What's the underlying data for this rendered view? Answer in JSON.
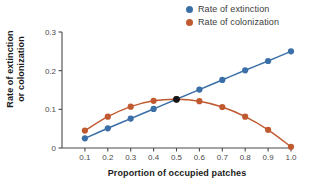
{
  "chart_data": {
    "type": "line",
    "title": "",
    "xlabel": "Proportion of occupied patches",
    "ylabel": "Rate of extinction or colonization",
    "ylabel_line1": "Rate of extinction",
    "ylabel_line2": "or colonization",
    "x": [
      0.1,
      0.2,
      0.3,
      0.4,
      0.5,
      0.6,
      0.7,
      0.8,
      0.9,
      1.0
    ],
    "xlim": [
      0.0,
      1.0
    ],
    "ylim": [
      0.0,
      0.3
    ],
    "xticks": [
      0.1,
      0.2,
      0.3,
      0.4,
      0.5,
      0.6,
      0.7,
      0.8,
      0.9,
      1.0
    ],
    "xtick_labels": [
      "0.1",
      "0.2",
      "0.3",
      "0.4",
      "0.5",
      "0.6",
      "0.7",
      "0.8",
      "0.9",
      "1.0"
    ],
    "yticks": [
      0,
      0.1,
      0.2,
      0.3
    ],
    "ytick_labels": [
      "0",
      "0.1",
      "0.2",
      "0.3"
    ],
    "grid": false,
    "legend_position": "top-right",
    "series": [
      {
        "name": "Rate of extinction",
        "color": "#3a6fa8",
        "marker": "circle",
        "values": [
          0.025,
          0.051,
          0.076,
          0.101,
          0.126,
          0.151,
          0.176,
          0.201,
          0.225,
          0.25
        ]
      },
      {
        "name": "Rate of colonization",
        "color": "#c0592f",
        "marker": "circle",
        "values": [
          0.045,
          0.081,
          0.107,
          0.122,
          0.126,
          0.121,
          0.106,
          0.081,
          0.047,
          0.003
        ]
      }
    ],
    "annotations": [
      {
        "name": "equilibrium-point",
        "x": 0.5,
        "y": 0.126,
        "color": "#151515",
        "label": ""
      }
    ]
  },
  "legend": {
    "items": [
      {
        "label": "Rate of extinction",
        "color": "#3a6fa8",
        "icon": "legend-dot-icon"
      },
      {
        "label": "Rate of colonization",
        "color": "#c0592f",
        "icon": "legend-dot-icon"
      }
    ]
  },
  "axes": {
    "x_title": "Proportion of occupied patches",
    "y_title_line1": "Rate of extinction",
    "y_title_line2": "or colonization",
    "axis_color": "#4a4a4a"
  }
}
